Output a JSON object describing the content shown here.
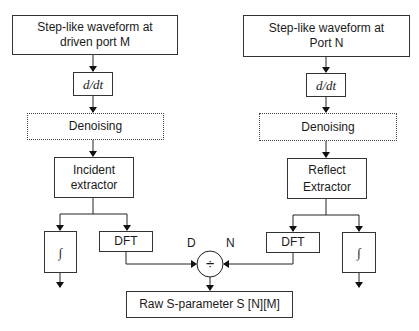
{
  "diagram": {
    "left_chain": {
      "source": "Step-like waveform at driven port M",
      "source_line1": "Step-like waveform at",
      "source_line2": "driven port M",
      "derivative": "d/dt",
      "denoise": "Denoising",
      "extractor_line1": "Incident",
      "extractor_line2": "extractor",
      "integral": "∫",
      "dft": "DFT"
    },
    "right_chain": {
      "source": "Step-like waveform at Port N",
      "source_line1": "Step-like waveform at",
      "source_line2": "Port N",
      "derivative": "d/dt",
      "denoise": "Denoising",
      "extractor_line1": "Reflect",
      "extractor_line2": "Extractor",
      "integral": "∫",
      "dft": "DFT"
    },
    "divider": {
      "symbol": "÷",
      "denominator_label": "D",
      "numerator_label": "N"
    },
    "output": "Raw S-parameter S [N][M]"
  }
}
